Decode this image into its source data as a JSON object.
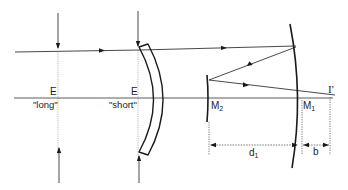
{
  "figure": {
    "colors": {
      "line": "#1a1a1a",
      "guide": "#9a9a9a",
      "background": "#ffffff"
    }
  },
  "labels": {
    "entrance_long": {
      "letter": "E",
      "note": "\"long\""
    },
    "entrance_short": {
      "letter": "E",
      "note": "\"short\""
    },
    "mirror2": {
      "letter": "M",
      "sub": "2"
    },
    "mirror1": {
      "letter": "M",
      "sub": "1"
    },
    "image": "I'",
    "distance_d1": {
      "letter": "d",
      "sub": "1"
    },
    "distance_b": "b"
  },
  "elements": {
    "optical_axis": "optical-axis",
    "incoming_ray": "incoming-ray",
    "corrector_lens": "meniscus-lens",
    "primary_mirror": "M1",
    "secondary_mirror": "M2",
    "image_point": "I'"
  }
}
